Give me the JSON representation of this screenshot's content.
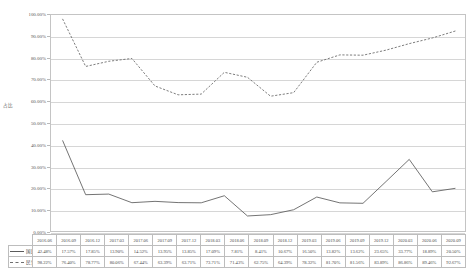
{
  "chart_data": {
    "type": "line",
    "title": "",
    "xlabel": "",
    "ylabel": "占比",
    "ylim": [
      0,
      100
    ],
    "ytick_labels": [
      "100.00%",
      "90.00%",
      "80.00%",
      "70.00%",
      "60.00%",
      "50.00%",
      "40.00%",
      "30.00%",
      "20.00%",
      "10.00%",
      "0.00%"
    ],
    "grid": true,
    "legend_position": "table-left",
    "categories": [
      "2016.06",
      "2016.09",
      "2016.12",
      "2017.03",
      "2017.06",
      "2017.09",
      "2017.12",
      "2018.03",
      "2018.06",
      "2018.09",
      "2018.12",
      "2019.03",
      "2019.06",
      "2019.09",
      "2019.12",
      "2020.03",
      "2020.06",
      "2020.09"
    ],
    "series": [
      {
        "name": "国民营",
        "style": "solid",
        "color": "#5b5b5b",
        "values": [
          42.48,
          17.57,
          17.85,
          13.9,
          14.52,
          13.95,
          13.85,
          17.09,
          7.81,
          8.41,
          10.67,
          16.5,
          13.82,
          13.62,
          23.65,
          33.77,
          18.89,
          20.5
        ],
        "labels": [
          "42.48%",
          "17.57%",
          "17.85%",
          "13.90%",
          "14.52%",
          "13.95%",
          "13.85%",
          "17.09%",
          "7.81%",
          "8.41%",
          "10.67%",
          "16.50%",
          "13.82%",
          "13.62%",
          "23.65%",
          "33.77%",
          "18.89%",
          "20.50%"
        ]
      },
      {
        "name": "民营量",
        "style": "dashed",
        "color": "#6e6e6e",
        "values": [
          98.22,
          76.4,
          78.77,
          80.06,
          67.44,
          63.39,
          63.71,
          73.71,
          71.43,
          62.75,
          64.39,
          78.32,
          81.7,
          81.56,
          83.89,
          86.86,
          89.46,
          92.67
        ],
        "labels": [
          "98.22%",
          "76.40%",
          "78.77%",
          "80.06%",
          "67.44%",
          "63.39%",
          "63.71%",
          "73.71%",
          "71.43%",
          "62.75%",
          "64.39%",
          "78.32%",
          "81.70%",
          "81.56%",
          "83.89%",
          "86.86%",
          "89.46%",
          "92.67%"
        ]
      }
    ]
  },
  "table": {
    "corner": "",
    "header": [
      "2016.06",
      "2016.09",
      "2016.12",
      "2017.03",
      "2017.06",
      "2017.09",
      "2017.12",
      "2018.03",
      "2018.06",
      "2018.09",
      "2018.12",
      "2019.03",
      "2019.06",
      "2019.09",
      "2019.12",
      "2020.03",
      "2020.06",
      "2020.09"
    ],
    "rows": [
      {
        "label": "国民营",
        "style": "solid",
        "values": [
          "42.48%",
          "17.57%",
          "17.85%",
          "13.90%",
          "14.52%",
          "13.95%",
          "13.85%",
          "17.09%",
          "7.81%",
          "8.41%",
          "10.67%",
          "16.50%",
          "13.82%",
          "13.62%",
          "23.65%",
          "33.77%",
          "18.89%",
          "20.50%"
        ]
      },
      {
        "label": "民营量",
        "style": "dashed",
        "values": [
          "98.22%",
          "76.40%",
          "78.77%",
          "80.06%",
          "67.44%",
          "63.39%",
          "63.71%",
          "73.71%",
          "71.43%",
          "62.75%",
          "64.39%",
          "78.32%",
          "81.70%",
          "81.56%",
          "83.89%",
          "86.86%",
          "89.46%",
          "92.67%"
        ]
      }
    ]
  }
}
